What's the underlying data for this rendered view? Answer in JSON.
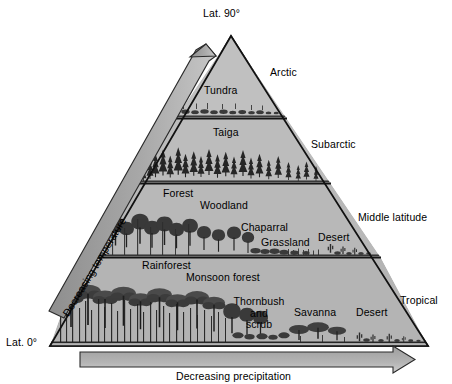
{
  "diagram": {
    "type": "conceptual-pyramid"
  },
  "axes": {
    "apex_label": "Lat. 90°",
    "base_label": "Lat. 0°",
    "vertical_arrow_label": "Decreasing temperature",
    "horizontal_arrow_label": "Decreasing precipitation"
  },
  "zones": [
    {
      "name": "Arctic",
      "biomes": [
        "Tundra"
      ]
    },
    {
      "name": "Subarctic",
      "biomes": [
        "Taiga"
      ]
    },
    {
      "name": "Middle latitude",
      "biomes": [
        "Forest",
        "Woodland",
        "Chaparral",
        "Grassland",
        "Desert"
      ]
    },
    {
      "name": "Tropical",
      "biomes": [
        "Rainforest",
        "Monsoon forest",
        "Thornbush and scrub",
        "Savanna",
        "Desert"
      ]
    }
  ],
  "zone_labels": {
    "arctic": "Arctic",
    "subarctic": "Subarctic",
    "middle_latitude": "Middle latitude",
    "tropical": "Tropical"
  },
  "biome_labels": {
    "tundra": "Tundra",
    "taiga": "Taiga",
    "forest": "Forest",
    "woodland": "Woodland",
    "chaparral": "Chaparral",
    "grassland": "Grassland",
    "desert_mid": "Desert",
    "rainforest": "Rainforest",
    "monsoon_forest": "Monsoon forest",
    "thornbush_line1": "Thornbush",
    "thornbush_line2": "and",
    "thornbush_line3": "scrub",
    "savanna": "Savanna",
    "desert_tropical": "Desert"
  },
  "colors": {
    "fill": "#b6b6b6",
    "fill_light": "#c2c2c2",
    "arrow_fill": "#9a9a9a",
    "arrow_fill_light": "#b0b0b0",
    "outline": "#111111",
    "divider": "#1a1a1a",
    "background": "#ffffff",
    "text": "#000000",
    "vegetation": "#2a2a2a"
  }
}
